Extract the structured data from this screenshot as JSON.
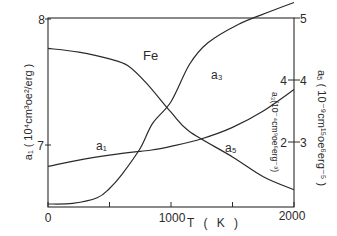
{
  "chart_data": {
    "type": "line",
    "title": "Fe",
    "xlabel": "T ( K )",
    "xlim": [
      0,
      2000
    ],
    "xticks": [
      0,
      500,
      1000,
      1500,
      2000
    ],
    "xtick_labels": [
      "0",
      "1000",
      "2000"
    ],
    "axes": {
      "left": {
        "label": "a₁ ( 10⁴cm³oe²/erg )",
        "ylim": [
          6.5,
          8
        ],
        "tick_labels": [
          "7",
          "8"
        ],
        "ticks": [
          7,
          8
        ]
      },
      "right_inner": {
        "label": "a₃(10⁻⁴cm⁹oe⁶erg⁻³)",
        "ylim": [
          0,
          8.2
        ],
        "tick_labels": [
          "2",
          "4"
        ],
        "ticks": [
          2,
          4
        ]
      },
      "right_outer": {
        "label": "a₅ ( 10⁻⁹cm¹⁵oe⁶erg⁻⁵ )",
        "ylim": [
          1.95,
          5
        ],
        "tick_labels": [
          "3",
          "4",
          "5"
        ],
        "ticks": [
          3,
          4,
          5
        ]
      }
    },
    "grid": false,
    "legend": "inline labels",
    "series": [
      {
        "name": "a1",
        "label": "a₁",
        "axis": "left",
        "x": [
          0,
          250,
          500,
          750,
          842,
          1000,
          1250,
          1500,
          1750,
          2000
        ],
        "y": [
          6.83,
          6.88,
          6.92,
          6.95,
          6.96,
          6.99,
          7.05,
          7.14,
          7.27,
          7.44
        ]
      },
      {
        "name": "a3",
        "label": "a₃",
        "axis": "right_inner",
        "x": [
          0,
          200,
          400,
          500,
          600,
          750,
          850,
          1000,
          1150,
          1300,
          1550,
          1800,
          2000
        ],
        "y": [
          0.0,
          0.02,
          0.2,
          0.5,
          0.95,
          1.8,
          2.6,
          3.3,
          4.5,
          5.2,
          5.8,
          6.2,
          6.5
        ]
      },
      {
        "name": "a5",
        "label": "a₅",
        "axis": "right_outer",
        "x": [
          0,
          250,
          500,
          650,
          800,
          1000,
          1150,
          1500,
          1750,
          2000
        ],
        "y": [
          4.51,
          4.45,
          4.34,
          4.23,
          3.95,
          3.48,
          3.17,
          2.76,
          2.44,
          2.23
        ]
      }
    ],
    "annotations": [
      "Fe",
      "a₁",
      "a₃",
      "a₅",
      "a₃(10⁻⁴cm⁹oe⁶erg⁻³)"
    ]
  }
}
